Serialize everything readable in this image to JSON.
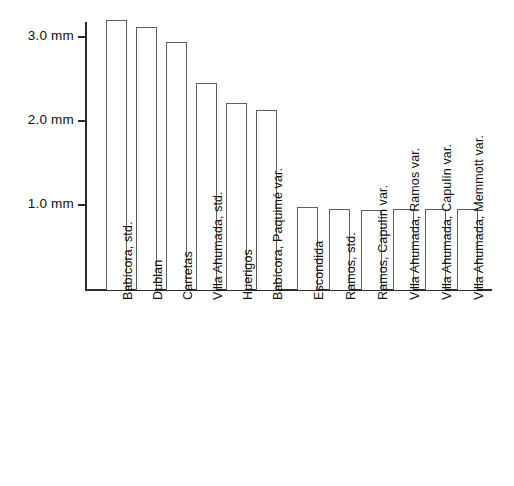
{
  "chart_data": {
    "type": "bar",
    "title": "",
    "subtitle": "",
    "xlabel": "",
    "ylabel": "",
    "categories": [
      "Babícora, std.",
      "Dublan",
      "Carretas",
      "Villa Ahumada, std.",
      "Huerigos",
      "Babícora, Paquimé var.",
      "Escondida",
      "Ramos, std.",
      "Ramos, Capulín var.",
      "Villa Ahumada, Ramos var.",
      "Villa Ahumada, Capulín var.",
      "Villa Ahumada, Memmott var."
    ],
    "values": [
      3.2,
      3.12,
      2.94,
      2.45,
      2.22,
      2.13,
      0.98,
      0.95,
      0.94,
      0.95,
      0.95,
      0.95
    ],
    "units": "mm",
    "ytick_values": [
      1.0,
      2.0,
      3.0
    ],
    "ytick_labels": [
      "1.0 mm",
      "2.0 mm",
      "3.0 mm"
    ],
    "ylim": [
      0,
      3.45
    ],
    "grid": false,
    "legend": null,
    "bar_fill_color": "#ffffff",
    "bar_edge_color": "#5e5e5e",
    "axis_color": "#2b2b2b",
    "text_color": "#111111"
  },
  "layout": {
    "plot_left_px": 85,
    "plot_baseline_px": 289,
    "plot_top_px": 22,
    "plot_right_px": 492,
    "px_per_mm": 84.0,
    "bar_geometry": [
      {
        "left": 106,
        "width": 21
      },
      {
        "left": 136,
        "width": 21
      },
      {
        "left": 166,
        "width": 21
      },
      {
        "left": 196,
        "width": 21
      },
      {
        "left": 226,
        "width": 21
      },
      {
        "left": 256,
        "width": 21
      },
      {
        "left": 297,
        "width": 21
      },
      {
        "left": 329,
        "width": 21
      },
      {
        "left": 361,
        "width": 21
      },
      {
        "left": 393,
        "width": 21
      },
      {
        "left": 425,
        "width": 21
      },
      {
        "left": 457,
        "width": 21
      }
    ],
    "label_anchor_y": 300,
    "label_anchor_offsets": [
      0,
      0,
      0,
      0,
      0,
      0,
      0,
      0,
      0,
      0,
      0,
      0
    ]
  }
}
